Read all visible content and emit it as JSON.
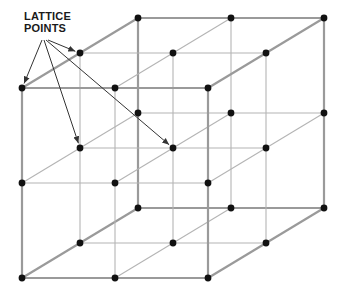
{
  "diagram": {
    "title": "Lattice",
    "label_line1": "LATTICE",
    "label_line2": "POINTS",
    "grid_size": [
      3,
      3,
      3
    ],
    "arrow_targets": [
      [
        0,
        0,
        0
      ],
      [
        0,
        1,
        1
      ],
      [
        1,
        1,
        1
      ],
      [
        0,
        0,
        1
      ]
    ],
    "colors": {
      "edge_outer": "#9a9a9a",
      "edge_inner": "#b4b4b4",
      "point": "#111111",
      "arrow": "#333333",
      "background": "#ffffff"
    }
  }
}
